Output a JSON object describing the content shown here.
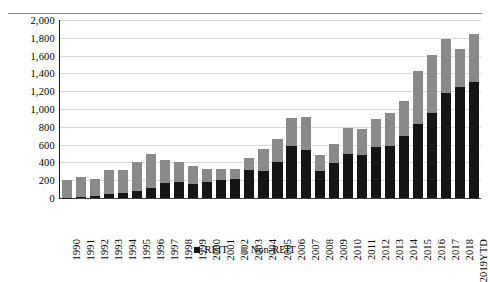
{
  "chart_data": {
    "type": "bar",
    "title": "",
    "subtitle": "",
    "xlabel": "",
    "ylabel": "US$bn",
    "ylim": [
      0,
      2000
    ],
    "ytick_step": 200,
    "yticks": [
      "0",
      "200",
      "400",
      "600",
      "800",
      "1,000",
      "1,200",
      "1,400",
      "1,600",
      "1,800",
      "2,000"
    ],
    "grid": true,
    "stacked": true,
    "legend_position": "bottom-center",
    "categories": [
      "1990",
      "1991",
      "1992",
      "1993",
      "1994",
      "1995",
      "1996",
      "1997",
      "1998",
      "1999",
      "2000",
      "2001",
      "2002",
      "2003",
      "2004",
      "2005",
      "2006",
      "2007",
      "2008",
      "2009",
      "2010",
      "2011",
      "2012",
      "2013",
      "2014",
      "2015",
      "2016",
      "2017",
      "2018",
      "2019YTD"
    ],
    "series": [
      {
        "name": "REIT",
        "color": "#151515",
        "values": [
          5,
          15,
          20,
          45,
          60,
          75,
          115,
          170,
          175,
          155,
          180,
          200,
          210,
          320,
          300,
          410,
          590,
          540,
          300,
          390,
          500,
          480,
          575,
          590,
          695,
          830,
          960,
          1180,
          1245,
          1300
        ]
      },
      {
        "name": "Non-REIT",
        "color": "#8a8a8a",
        "values": [
          200,
          225,
          190,
          270,
          260,
          325,
          380,
          255,
          230,
          200,
          145,
          130,
          120,
          130,
          250,
          250,
          310,
          375,
          180,
          215,
          290,
          290,
          315,
          370,
          400,
          595,
          650,
          605,
          425,
          540
        ]
      }
    ],
    "totals": [
      205,
      240,
      210,
      315,
      320,
      400,
      495,
      425,
      405,
      355,
      325,
      330,
      330,
      450,
      550,
      660,
      900,
      915,
      480,
      605,
      790,
      770,
      890,
      960,
      1095,
      1425,
      1610,
      1785,
      1670,
      1840
    ],
    "legend": [
      "REIT",
      "Non-REIT"
    ]
  }
}
